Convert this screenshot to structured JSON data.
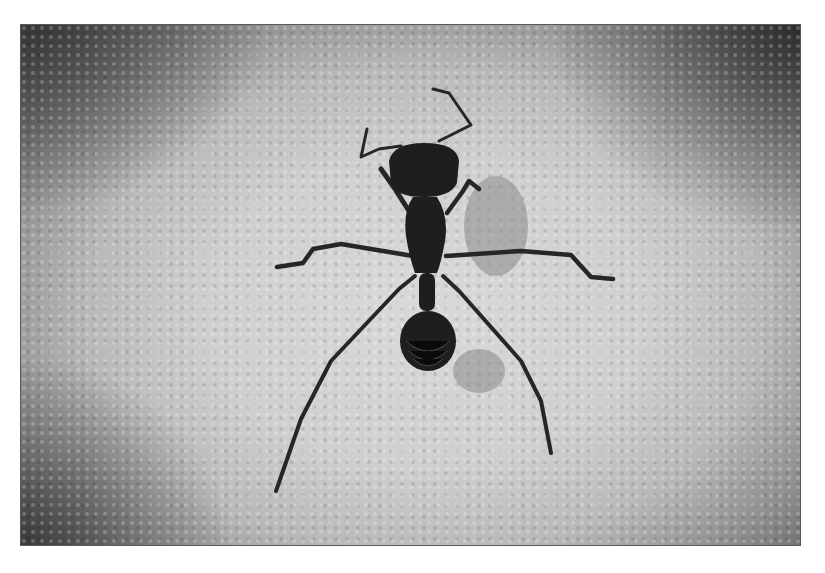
{
  "image": {
    "kind": "photograph",
    "description": "Grayscale top-down photograph of a long-legged ant on white sand grains",
    "subject": "ant",
    "background": "sand",
    "color_mode": "grayscale",
    "colors": {
      "page_background": "#ffffff",
      "frame_border": "#5a5a5a",
      "sand_light": "#d9d9d9",
      "sand_dark_edges": "#5b5b5b",
      "ant_body": "#1e1e1e",
      "shadow": "#8a8a8a"
    }
  }
}
